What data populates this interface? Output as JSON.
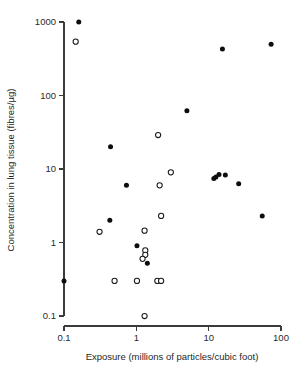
{
  "chart_data": {
    "type": "scatter",
    "title": "",
    "xlabel": "Exposure (millions of particles/cubic foot)",
    "ylabel": "Concentration in lung tissue (fibres/µg)",
    "xscale": "log",
    "yscale": "log",
    "xlim": [
      0.1,
      100
    ],
    "ylim": [
      0.1,
      1000
    ],
    "grid": false,
    "legend": "none",
    "xticks": [
      "0.1",
      "1",
      "10",
      "100"
    ],
    "xtick_values": [
      0.1,
      1,
      10,
      100
    ],
    "yticks": [
      "1000",
      "100",
      "10",
      "1",
      "0.1"
    ],
    "ytick_values": [
      1000,
      100,
      10,
      1,
      0.1
    ],
    "marker_colors": {
      "filled": "#0d0d0d",
      "open_stroke": "#1a1a1a",
      "open_fill": "#ffffff",
      "axis": "#3b3b3b"
    },
    "series": [
      {
        "name": "filled",
        "marker": "filled-circle",
        "points": [
          [
            0.16,
            1000
          ],
          [
            15.5,
            430
          ],
          [
            73,
            500
          ],
          [
            5.0,
            62
          ],
          [
            0.44,
            20
          ],
          [
            0.73,
            6.0
          ],
          [
            11.8,
            7.4
          ],
          [
            12.6,
            7.8
          ],
          [
            13.9,
            8.4
          ],
          [
            17.0,
            8.3
          ],
          [
            26,
            6.3
          ],
          [
            55,
            2.3
          ],
          [
            0.43,
            2.0
          ],
          [
            1.02,
            0.9
          ],
          [
            1.42,
            0.52
          ],
          [
            0.1,
            0.3
          ]
        ]
      },
      {
        "name": "open",
        "marker": "open-circle",
        "points": [
          [
            0.145,
            540
          ],
          [
            2.0,
            29
          ],
          [
            3.0,
            9.0
          ],
          [
            2.1,
            6.0
          ],
          [
            2.2,
            2.3
          ],
          [
            0.31,
            1.4
          ],
          [
            1.3,
            1.45
          ],
          [
            1.33,
            0.78
          ],
          [
            1.33,
            0.68
          ],
          [
            1.22,
            0.6
          ],
          [
            0.5,
            0.3
          ],
          [
            1.02,
            0.3
          ],
          [
            1.95,
            0.3
          ],
          [
            2.2,
            0.3
          ],
          [
            1.3,
            0.1
          ]
        ]
      }
    ]
  }
}
